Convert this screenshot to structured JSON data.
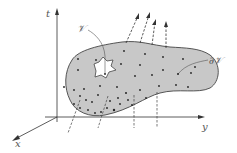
{
  "labels": {
    "t_axis": "t",
    "x_axis": "x",
    "y_axis": "y",
    "volume": "𝒱",
    "boundary": "∂𝒱"
  },
  "colors": {
    "region_fill": "#c8c8c8",
    "outline": "#444444",
    "axis": "#333333",
    "hole_fill": "#ffffff",
    "dot": "#222222"
  },
  "arrows_count": 4,
  "dashed_lines_below": 2
}
